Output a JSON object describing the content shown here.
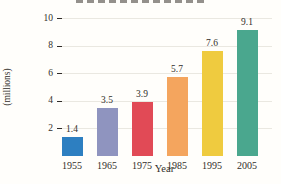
{
  "figure": {
    "y_axis_label_line1": "Number of Words",
    "y_axis_label_line2": "(millions)",
    "x_axis_label": "Year"
  },
  "chart_data": {
    "type": "bar",
    "categories": [
      "1955",
      "1965",
      "1975",
      "1985",
      "1995",
      "2005"
    ],
    "values": [
      1.4,
      3.5,
      3.9,
      5.7,
      7.6,
      9.1
    ],
    "value_labels": [
      "1.4",
      "3.5",
      "3.9",
      "5.7",
      "7.6",
      "9.1"
    ],
    "bar_colors": [
      "#2d7fc1",
      "#8f94bf",
      "#e14a56",
      "#f4a55e",
      "#efcb3f",
      "#4aa78e"
    ],
    "title": "",
    "xlabel": "Year",
    "ylabel": "Number of Words (millions)",
    "ylim": [
      0,
      10
    ],
    "yticks": [
      2,
      4,
      6,
      8,
      10
    ],
    "grid": true,
    "legend": "none",
    "colors": {
      "axis": "#2f2b28",
      "grid": "#eae8e1",
      "text": "#322e2a",
      "plot_bg": "#fffefb"
    }
  }
}
